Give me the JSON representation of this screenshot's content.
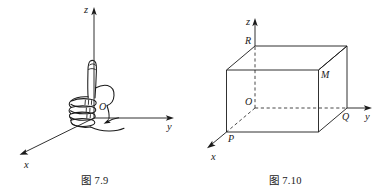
{
  "page": {
    "background_color": "#ffffff",
    "ink_color": "#1a1a1a",
    "width": 381,
    "height": 196
  },
  "figures": [
    {
      "id": "fig-7-9",
      "caption": "图 7.9",
      "kind": "right-hand-rule-diagram",
      "description": "Right-hand rule illustration: a closed fist with thumb pointing up along the z axis of a 3D coordinate frame, with a curved arrow showing the sense of rotation from x toward y.",
      "axes": [
        {
          "name": "z-axis",
          "label": "z",
          "direction": "up"
        },
        {
          "name": "y-axis",
          "label": "y",
          "direction": "right"
        },
        {
          "name": "x-axis",
          "label": "x",
          "direction": "lower-left"
        }
      ],
      "origin_label": "O",
      "rotation_arrow": "counterclockwise-from-x-to-y"
    },
    {
      "id": "fig-7-10",
      "caption": "图 7.10",
      "kind": "rectangular-box-diagram",
      "description": "A rectangular box drawn in a 3D coordinate frame with origin O at a hidden interior corner; hidden edges along the axes are dashed.",
      "axes": [
        {
          "name": "z-axis",
          "label": "z",
          "direction": "up"
        },
        {
          "name": "y-axis",
          "label": "y",
          "direction": "right"
        },
        {
          "name": "x-axis",
          "label": "x",
          "direction": "lower-left"
        }
      ],
      "vertices": [
        {
          "name": "vertex-R",
          "label": "R",
          "on_axis": "z"
        },
        {
          "name": "vertex-M",
          "label": "M",
          "on_axis": "none"
        },
        {
          "name": "vertex-Q",
          "label": "Q",
          "on_axis": "y"
        },
        {
          "name": "vertex-P",
          "label": "P",
          "on_axis": "x"
        },
        {
          "name": "origin-O",
          "label": "O",
          "on_axis": "origin"
        }
      ]
    }
  ]
}
